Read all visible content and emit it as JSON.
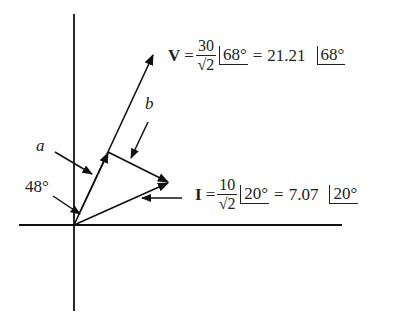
{
  "diagram": {
    "type": "phasor-diagram",
    "line_color": "#111111",
    "labels": {
      "a": "a",
      "b": "b",
      "angle": "48°"
    },
    "voltage": {
      "symbol": "V",
      "equals": "=",
      "numerator": "30",
      "denominator": "√2",
      "angle1": "68°",
      "equals2": "=",
      "magnitude": "21.21",
      "angle2": "68°"
    },
    "current": {
      "symbol": "I",
      "equals": "=",
      "numerator": "10",
      "denominator": "√2",
      "angle1": "20°",
      "equals2": "=",
      "magnitude": "7.07",
      "angle2": "20°"
    }
  }
}
